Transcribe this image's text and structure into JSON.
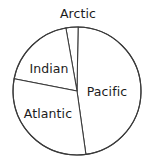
{
  "chart_data": {
    "type": "pie",
    "title": "",
    "subtitle": "",
    "xlabel": "",
    "ylabel": "",
    "legend_position": "none",
    "grid": false,
    "labels_inside": true,
    "center": {
      "x": 77,
      "y": 91
    },
    "radius": 64,
    "outline_color": "#3a3a3a",
    "slice_fill": "#ffffff",
    "label_color": "#1c1c1c",
    "categories": [
      "Pacific",
      "Arctic",
      "Indian",
      "Atlantic"
    ],
    "values": [
      171,
      11,
      69,
      109
    ],
    "unit": "degrees",
    "slices": [
      {
        "name": "Pacific",
        "label": "Pacific",
        "start_angle": -82,
        "end_angle": 89,
        "sweep": 171,
        "percent": 47.5,
        "label_x": 107,
        "label_y": 91
      },
      {
        "name": "Arctic",
        "label": "Arctic",
        "start_angle": 89,
        "end_angle": 100,
        "sweep": 11,
        "percent": 3.1,
        "label_x": 78,
        "label_y": 13
      },
      {
        "name": "Indian",
        "label": "Indian",
        "start_angle": 100,
        "end_angle": 169,
        "sweep": 69,
        "percent": 19.2,
        "label_x": 49,
        "label_y": 68
      },
      {
        "name": "Atlantic",
        "label": "Atlantic",
        "start_angle": 169,
        "end_angle": 278,
        "sweep": 109,
        "percent": 30.3,
        "label_x": 48,
        "label_y": 113
      }
    ]
  },
  "labels": {
    "arctic": "Arctic",
    "pacific": "Pacific",
    "indian": "Indian",
    "atlantic": "Atlantic"
  }
}
